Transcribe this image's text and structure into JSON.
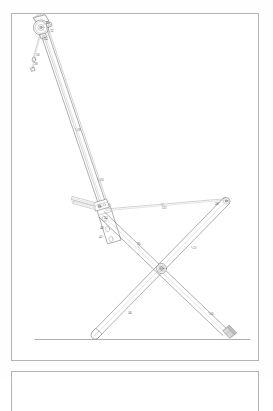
{
  "document": {
    "kind": "patent-figure-sheet",
    "background_color": "#fefefe",
    "frame_color": "#b4b4b4",
    "line_color": "#7d7d7d"
  },
  "figure": {
    "title": "",
    "caption": ""
  },
  "frames": [
    {
      "name": "main-figure-frame",
      "x": 11,
      "y": 13,
      "width": 248,
      "height": 348
    },
    {
      "name": "next-figure-frame",
      "x": 11,
      "y": 371,
      "width": 248,
      "height": 40
    }
  ],
  "reference_numerals": [
    {
      "label": "30",
      "x": 46,
      "y": 24
    },
    {
      "label": "32",
      "x": 50,
      "y": 32
    },
    {
      "label": "34",
      "x": 44,
      "y": 40
    },
    {
      "label": "36",
      "x": 36,
      "y": 56
    },
    {
      "label": "38",
      "x": 34,
      "y": 65
    },
    {
      "label": "18",
      "x": 77,
      "y": 131
    },
    {
      "label": "20",
      "x": 100,
      "y": 181
    },
    {
      "label": "22",
      "x": 163,
      "y": 209
    },
    {
      "label": "24",
      "x": 104,
      "y": 219
    },
    {
      "label": "26",
      "x": 137,
      "y": 245
    },
    {
      "label": "12",
      "x": 193,
      "y": 249
    },
    {
      "label": "28",
      "x": 215,
      "y": 205
    },
    {
      "label": "14",
      "x": 128,
      "y": 314
    },
    {
      "label": "16",
      "x": 210,
      "y": 315
    },
    {
      "label": "40",
      "x": 100,
      "y": 229
    },
    {
      "label": "42",
      "x": 99,
      "y": 238
    }
  ],
  "components": [
    {
      "name": "mast",
      "description": "Inclined twin-line mast running from upper-left head to lower bracket"
    },
    {
      "name": "head-assembly",
      "description": "Circular pulley head with housing at top of mast"
    },
    {
      "name": "pull-cord",
      "description": "Short dangling cord element below the head"
    },
    {
      "name": "adjustment-bracket",
      "description": "Slotted bracket on mast with three apertures"
    },
    {
      "name": "front-leg",
      "description": "Left-descending leg of the X frame"
    },
    {
      "name": "rear-leg",
      "description": "Right-descending leg of the X frame"
    },
    {
      "name": "center-pivot",
      "description": "Circular hub where the legs cross"
    },
    {
      "name": "seat-rail",
      "description": "Thin tension rail from bracket to rear leg top"
    },
    {
      "name": "front-foot",
      "description": "Outlined foot resting on ground line"
    },
    {
      "name": "rear-foot",
      "description": "Shaded foot cap resting on ground line"
    },
    {
      "name": "ground-line",
      "description": "Horizontal floor reference line"
    }
  ]
}
